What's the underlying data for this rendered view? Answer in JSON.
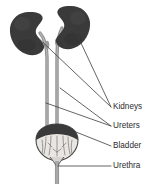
{
  "diagram": {
    "type": "anatomical-illustration",
    "background_color": "#ffffff",
    "organ_color": "#3a3a3a",
    "tube_color": "#8a8a8a",
    "line_color": "#3c3c3c",
    "text_color": "#2b2b2b",
    "labels": [
      {
        "id": "kidneys",
        "text": "Kidneys",
        "x": 113,
        "y": 107,
        "leader": {
          "from_x": 112,
          "from_y": 107,
          "to_x": 71,
          "to_y": 27,
          "second_to_x": 29,
          "second_to_y": 34
        }
      },
      {
        "id": "ureters",
        "text": "Ureters",
        "x": 113,
        "y": 126,
        "leader": {
          "from_x": 112,
          "from_y": 126,
          "to_x": 64,
          "to_y": 87,
          "second_to_x": 45,
          "second_to_y": 100
        }
      },
      {
        "id": "bladder",
        "text": "Bladder",
        "x": 113,
        "y": 146,
        "leader": {
          "from_x": 112,
          "from_y": 146,
          "to_x": 72,
          "to_y": 131,
          "second_to_x": null,
          "second_to_y": null
        }
      },
      {
        "id": "urethra",
        "text": "Urethra",
        "x": 113,
        "y": 166,
        "leader": {
          "from_x": 112,
          "from_y": 166,
          "to_x": 59,
          "to_y": 166,
          "second_to_x": null,
          "second_to_y": null
        }
      }
    ],
    "organs": {
      "left_kidney": {
        "cx": 29,
        "cy": 34,
        "label": "left-kidney"
      },
      "right_kidney": {
        "cx": 71,
        "cy": 28,
        "label": "right-kidney"
      },
      "left_ureter": {
        "label": "left-ureter"
      },
      "right_ureter": {
        "label": "right-ureter"
      },
      "bladder": {
        "cx": 57,
        "cy": 139,
        "label": "bladder"
      },
      "urethra": {
        "label": "urethra"
      }
    }
  }
}
